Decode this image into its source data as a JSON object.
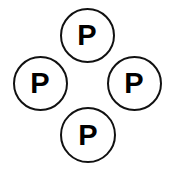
{
  "canvas": {
    "width": 172,
    "height": 171,
    "background_color": "#ffffff"
  },
  "style": {
    "stroke_color": "#111111",
    "stroke_width": 2,
    "fill_color": "#ffffff",
    "label_color": "#000000",
    "label_font_size": 29
  },
  "diagram": {
    "shape_type": "circle",
    "arrangement": "diamond",
    "node_count": 4,
    "nodes": [
      {
        "id": "node-top",
        "name": "top-circle",
        "label": "P",
        "cx": 87,
        "cy": 35,
        "diameter": 55
      },
      {
        "id": "node-left",
        "name": "left-circle",
        "label": "P",
        "cx": 40,
        "cy": 83,
        "diameter": 55
      },
      {
        "id": "node-right",
        "name": "right-circle",
        "label": "P",
        "cx": 134,
        "cy": 83,
        "diameter": 55
      },
      {
        "id": "node-bottom",
        "name": "bottom-circle",
        "label": "P",
        "cx": 88,
        "cy": 135,
        "diameter": 56
      }
    ]
  }
}
